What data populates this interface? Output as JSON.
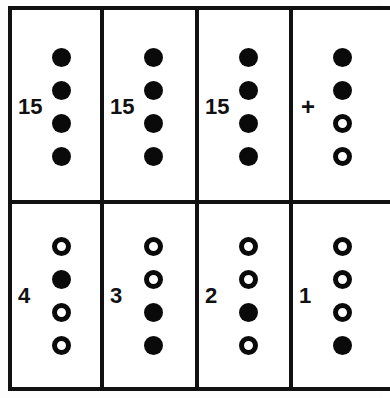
{
  "figure": {
    "title": ""
  },
  "grid": {
    "rows": 2,
    "columns": 4,
    "cells": [
      {
        "label": "15",
        "label_kind": "number",
        "dots": [
          {
            "state": "filled",
            "symbol": "●"
          },
          {
            "state": "filled",
            "symbol": "●"
          },
          {
            "state": "filled",
            "symbol": "●"
          },
          {
            "state": "filled",
            "symbol": "●"
          }
        ]
      },
      {
        "label": "15",
        "label_kind": "number",
        "dots": [
          {
            "state": "filled",
            "symbol": "●"
          },
          {
            "state": "filled",
            "symbol": "●"
          },
          {
            "state": "filled",
            "symbol": "●"
          },
          {
            "state": "filled",
            "symbol": "●"
          }
        ]
      },
      {
        "label": "15",
        "label_kind": "number",
        "dots": [
          {
            "state": "filled",
            "symbol": "●"
          },
          {
            "state": "filled",
            "symbol": "●"
          },
          {
            "state": "filled",
            "symbol": "●"
          },
          {
            "state": "filled",
            "symbol": "●"
          }
        ]
      },
      {
        "label": "+",
        "label_kind": "plus",
        "dots": [
          {
            "state": "filled",
            "symbol": "●"
          },
          {
            "state": "filled",
            "symbol": "●"
          },
          {
            "state": "open",
            "symbol": "○"
          },
          {
            "state": "open",
            "symbol": "○"
          }
        ]
      },
      {
        "label": "4",
        "label_kind": "number",
        "dots": [
          {
            "state": "open",
            "symbol": "○"
          },
          {
            "state": "filled",
            "symbol": "●"
          },
          {
            "state": "open",
            "symbol": "○"
          },
          {
            "state": "open",
            "symbol": "○"
          }
        ]
      },
      {
        "label": "3",
        "label_kind": "number",
        "dots": [
          {
            "state": "open",
            "symbol": "○"
          },
          {
            "state": "open",
            "symbol": "○"
          },
          {
            "state": "filled",
            "symbol": "●"
          },
          {
            "state": "filled",
            "symbol": "●"
          }
        ]
      },
      {
        "label": "2",
        "label_kind": "number",
        "dots": [
          {
            "state": "open",
            "symbol": "○"
          },
          {
            "state": "open",
            "symbol": "○"
          },
          {
            "state": "filled",
            "symbol": "●"
          },
          {
            "state": "open",
            "symbol": "○"
          }
        ]
      },
      {
        "label": "1",
        "label_kind": "number",
        "dots": [
          {
            "state": "open",
            "symbol": "○"
          },
          {
            "state": "open",
            "symbol": "○"
          },
          {
            "state": "open",
            "symbol": "○"
          },
          {
            "state": "filled",
            "symbol": "●"
          }
        ]
      }
    ]
  },
  "colors": {
    "ink": "#111111",
    "dot_fill": "#0a0a0a",
    "paper": "#ffffff"
  }
}
